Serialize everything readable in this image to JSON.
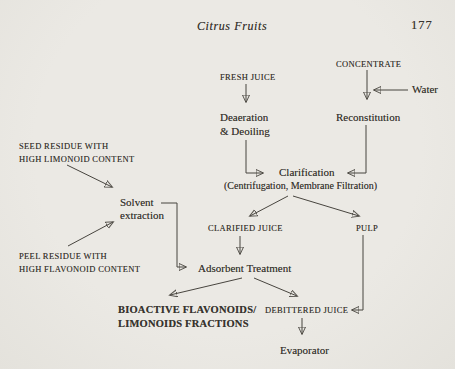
{
  "header": {
    "running_title": "Citrus Fruits",
    "page_number": "177"
  },
  "flowchart": {
    "nodes": {
      "fresh_juice": "FRESH JUICE",
      "concentrate": "CONCENTRATE",
      "water": "Water",
      "deaeration_line1": "Deaeration",
      "deaeration_line2": "& Deoiling",
      "reconstitution": "Reconstitution",
      "clarification": "Clarification",
      "clarification_methods": "(Centrifugation, Membrane Filtration)",
      "seed_residue_line1": "SEED RESIDUE WITH",
      "seed_residue_line2": "HIGH LIMONOID CONTENT",
      "solvent_extraction_line1": "Solvent",
      "solvent_extraction_line2": "extraction",
      "peel_residue_line1": "PEEL RESIDUE WITH",
      "peel_residue_line2": "HIGH FLAVONOID CONTENT",
      "clarified_juice": "CLARIFIED JUICE",
      "pulp": "PULP",
      "adsorbent_treatment": "Adsorbent Treatment",
      "bioactive_line1": "BIOACTIVE FLAVONOIDS/",
      "bioactive_line2": "LIMONOIDS FRACTIONS",
      "debittered_juice": "DEBITTERED JUICE",
      "evaporator": "Evaporator"
    }
  },
  "colors": {
    "ink": "#37342e",
    "paper": "#ebe9e4"
  }
}
